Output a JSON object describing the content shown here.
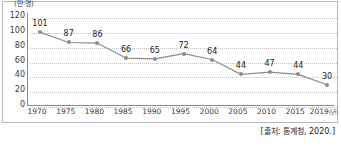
{
  "chart_data": {
    "type": "line",
    "title": "",
    "xlabel": "",
    "ylabel": "",
    "y_unit_label": "(만 명)",
    "x_axis_suffix": "(년)",
    "categories": [
      "1970",
      "1975",
      "1980",
      "1985",
      "1990",
      "1995",
      "2000",
      "2005",
      "2010",
      "2015",
      "2019"
    ],
    "values": [
      101,
      87,
      86,
      66,
      65,
      72,
      64,
      44,
      47,
      44,
      30
    ],
    "point_labels": [
      "101",
      "87",
      "86",
      "66",
      "65",
      "72",
      "64",
      "44",
      "47",
      "44",
      "30"
    ],
    "ylim": [
      0,
      120
    ],
    "y_ticks": [
      "0",
      "20",
      "40",
      "60",
      "80",
      "100",
      "120"
    ],
    "grid": true,
    "legend": "none",
    "series_color": "#8d8d8d",
    "grid_color": "#c2c2c2",
    "axis_color": "#8a8a8a",
    "text_color": "#1c1c1c"
  },
  "source": {
    "note": "[출처: 통계청, 2020.]"
  }
}
